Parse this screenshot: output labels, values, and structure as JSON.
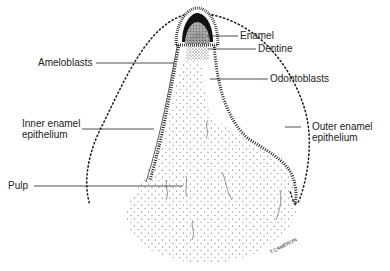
{
  "diagram": {
    "labels": {
      "enamel": "Enamel",
      "dentine": "Dentine",
      "odontoblasts": "Odontoblasts",
      "ameloblasts": "Ameloblasts",
      "inner_enamel_epithelium": "Inner enamel\nepithelium",
      "outer_enamel_epithelium": "Outer enamel\nepithelium",
      "pulp": "Pulp"
    },
    "signature": "T.CAMERON",
    "colors": {
      "ink": "#222222",
      "stipple": "#555555",
      "background": "#ffffff"
    }
  }
}
